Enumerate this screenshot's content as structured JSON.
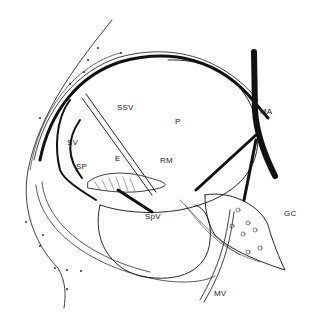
{
  "diagram": {
    "type": "anatomical line drawing",
    "labels": {
      "ssv": "SSV",
      "sv": "SV",
      "sp": "SP",
      "e": "E",
      "p": "P",
      "rm": "RM",
      "ma": "MA",
      "spv": "SpV",
      "gc": "GC",
      "mv": "MV"
    },
    "colors": {
      "line": "#111111",
      "background": "#ffffff"
    }
  }
}
